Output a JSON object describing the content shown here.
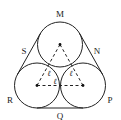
{
  "diagram": {
    "type": "three tangent circles with enclosing belt",
    "circles": [
      {
        "name": "top",
        "cx": 60,
        "cy": 44.5,
        "r": 22.5
      },
      {
        "name": "bottom-left",
        "cx": 37,
        "cy": 85.5,
        "r": 22.5
      },
      {
        "name": "bottom-right",
        "cx": 83,
        "cy": 85.5,
        "r": 22.5
      }
    ],
    "point_labels": [
      {
        "text": "M",
        "x": 60,
        "y": 14
      },
      {
        "text": "N",
        "x": 97,
        "y": 52
      },
      {
        "text": "P",
        "x": 110,
        "y": 101
      },
      {
        "text": "Q",
        "x": 60,
        "y": 117
      },
      {
        "text": "R",
        "x": 10,
        "y": 101
      },
      {
        "text": "S",
        "x": 24,
        "y": 52
      }
    ],
    "side_labels": [
      {
        "text": "ℓ",
        "x": 49,
        "y": 74
      },
      {
        "text": "ℓ",
        "x": 71,
        "y": 74
      },
      {
        "text": "ℓ",
        "x": 55,
        "y": 84
      }
    ],
    "stroke_color": "#222222",
    "background": "#ffffff"
  }
}
